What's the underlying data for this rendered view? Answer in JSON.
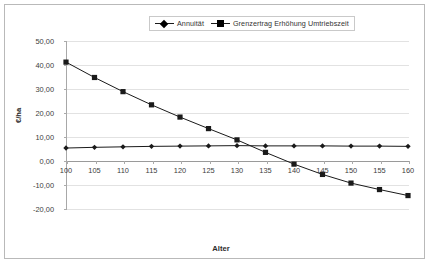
{
  "chart_data": {
    "type": "line",
    "title": "",
    "xlabel": "Alter",
    "ylabel": "€/ha",
    "x": [
      100,
      105,
      110,
      115,
      120,
      125,
      130,
      135,
      140,
      145,
      150,
      155,
      160
    ],
    "categories": [
      "100",
      "105",
      "110",
      "115",
      "120",
      "125",
      "130",
      "135",
      "140",
      "145",
      "150",
      "155",
      "160"
    ],
    "xlim": [
      100,
      160
    ],
    "ylim": [
      -20,
      50
    ],
    "ytick_labels": [
      "50,00",
      "40,00",
      "30,00",
      "20,00",
      "10,00",
      "0,00",
      "-10,00",
      "-20,00"
    ],
    "ytick_values": [
      50,
      40,
      30,
      20,
      10,
      0,
      -10,
      -20
    ],
    "grid": true,
    "legend_position": "top-center",
    "series": [
      {
        "name": "Annuität",
        "marker": "diamond",
        "color": "#1a1a1a",
        "values": [
          5.4,
          5.7,
          5.9,
          6.1,
          6.2,
          6.3,
          6.4,
          6.3,
          6.3,
          6.3,
          6.2,
          6.2,
          6.1
        ]
      },
      {
        "name": "Grenzertrag Erhöhung Umtriebszeit",
        "marker": "square",
        "color": "#1a1a1a",
        "values": [
          41.2,
          34.8,
          28.9,
          23.4,
          18.3,
          13.5,
          8.8,
          3.6,
          -1.3,
          -5.6,
          -9.2,
          -11.9,
          -14.4
        ]
      }
    ]
  },
  "legend": {
    "entries": [
      {
        "label": "Annuität"
      },
      {
        "label": "Grenzertrag  Erhöhung Umtriebszeit"
      }
    ]
  },
  "axes": {
    "x_title": "Alter",
    "y_title": "€/ha"
  }
}
